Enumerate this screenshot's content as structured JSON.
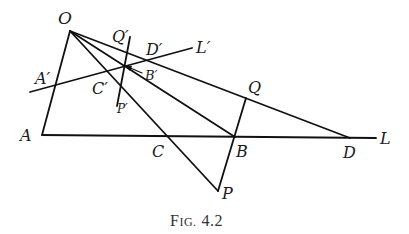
{
  "figure": {
    "caption": "Fig. 4.2",
    "caption_prefix": "F",
    "caption_smallcaps": "IG.",
    "caption_number": "4.2"
  },
  "points": {
    "O": "O",
    "A": "A",
    "C": "C",
    "B": "B",
    "D": "D",
    "L": "L",
    "P": "P",
    "Q": "Q",
    "A_prime": "A′",
    "C_prime": "C′",
    "B_prime": "B′",
    "D_prime": "D′",
    "L_prime": "L′",
    "P_prime": "P′",
    "Q_prime": "Q′"
  },
  "colors": {
    "line": "#111111",
    "text": "#1a1a1a",
    "background": "#ffffff"
  }
}
